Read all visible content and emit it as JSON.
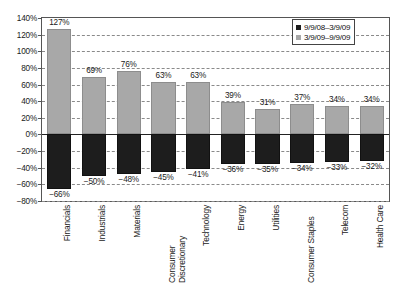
{
  "chart_data": {
    "type": "bar",
    "title": "",
    "subtitle": "",
    "xlabel": "",
    "ylabel": "",
    "ylim": [
      -80,
      140
    ],
    "ytick_step": 20,
    "grid": true,
    "grid_style": "dashed-horizontal",
    "legend_position": "top-right",
    "categories": [
      "Financials",
      "Industrials",
      "Materials",
      "Consumer Discretionary",
      "Technology",
      "Energy",
      "Utilities",
      "Consumer Staples",
      "Telecom",
      "Health Care"
    ],
    "ytick_labels": [
      "140%",
      "120%",
      "100%",
      "80%",
      "60%",
      "40%",
      "20%",
      "0%",
      "-20%",
      "-40%",
      "-60%",
      "-80%"
    ],
    "ytick_values": [
      140,
      120,
      100,
      80,
      60,
      40,
      20,
      0,
      -20,
      -40,
      -60,
      -80
    ],
    "series": [
      {
        "name": "9/9/08-3/9/09",
        "color": "#1d1d1d",
        "values": [
          -66,
          -50,
          -48,
          -45,
          -41,
          -36,
          -35,
          -34,
          -33,
          -32
        ],
        "labels": [
          "-66%",
          "-50%",
          "-48%",
          "-45%",
          "-41%",
          "-36%",
          "-35%",
          "-34%",
          "-33%",
          "-32%"
        ]
      },
      {
        "name": "3/9/09-9/9/09",
        "color": "#a8a8a8",
        "values": [
          127,
          69,
          76,
          63,
          63,
          39,
          31,
          37,
          34,
          34
        ],
        "labels": [
          "127%",
          "69%",
          "76%",
          "63%",
          "63%",
          "39%",
          "31%",
          "37%",
          "34%",
          "34%"
        ]
      }
    ]
  },
  "legend": {
    "items": [
      {
        "label": "9/9/08–3/9/09",
        "swatch": "dark"
      },
      {
        "label": "3/9/09–9/9/09",
        "swatch": "gray"
      }
    ]
  },
  "colors": {
    "dark_bar": "#1d1d1d",
    "gray_bar": "#a8a8a8",
    "grid": "#8a8a8a",
    "axis": "#555555",
    "text": "#1a1a1a",
    "background": "#ffffff"
  }
}
